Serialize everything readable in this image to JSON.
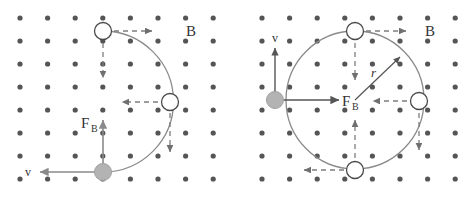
{
  "figure": {
    "title_text": "",
    "panels": [
      {
        "id": "left-panel",
        "name": "charged-particle-spiral-path",
        "field_label": "B",
        "force_label": "F",
        "force_sublabel": "B",
        "velocity_label": "v",
        "radius_label": "",
        "grid": {
          "dot_color": "#555555",
          "dot_radius": 2.6,
          "cols": 8,
          "rows": 8,
          "x_start": 20,
          "y_start": 18,
          "dx": 27.6,
          "dy": 23.0
        },
        "path_color": "#8a8a8a",
        "dashed_color": "#7d7d7d",
        "solid_arrow_color": "#8a8a8a",
        "particle_fill": "#b3b3b3",
        "particle_stroke": "#8a8a8a",
        "hollow_fill": "#ffffff",
        "hollow_stroke": "#4a4a4a",
        "markers": [
          {
            "name": "hollow-particle-top",
            "cx": 103,
            "cy": 31,
            "r": 8.5,
            "type": "hollow"
          },
          {
            "name": "hollow-particle-right",
            "cx": 170,
            "cy": 102,
            "r": 8.5,
            "type": "hollow"
          },
          {
            "name": "filled-particle-bottom",
            "cx": 103,
            "cy": 172,
            "r": 8.5,
            "type": "filled"
          }
        ]
      },
      {
        "id": "right-panel",
        "name": "charged-particle-circular-orbit",
        "field_label": "B",
        "force_label": "F",
        "force_sublabel": "B",
        "velocity_label": "v",
        "radius_label": "r",
        "grid": {
          "dot_color": "#555555",
          "dot_radius": 2.6,
          "cols": 8,
          "rows": 8,
          "x_start": 20,
          "y_start": 18,
          "dx": 27.6,
          "dy": 23.0
        },
        "path_color": "#8a8a8a",
        "dashed_color": "#7d7d7d",
        "solid_arrow_color": "#555555",
        "particle_fill": "#b3b3b3",
        "particle_stroke": "#8a8a8a",
        "hollow_fill": "#ffffff",
        "hollow_stroke": "#4a4a4a",
        "orbit": {
          "cx": 117,
          "cy": 100,
          "r": 69
        },
        "markers": [
          {
            "name": "hollow-particle-top",
            "cx": 117,
            "cy": 31,
            "r": 8.5,
            "type": "hollow"
          },
          {
            "name": "hollow-particle-right",
            "cx": 181,
            "cy": 101,
            "r": 8.5,
            "type": "hollow"
          },
          {
            "name": "hollow-particle-bottom",
            "cx": 117,
            "cy": 170,
            "r": 8.5,
            "type": "hollow"
          },
          {
            "name": "filled-particle-left",
            "cx": 37,
            "cy": 100,
            "r": 8.5,
            "type": "filled"
          }
        ]
      }
    ]
  }
}
